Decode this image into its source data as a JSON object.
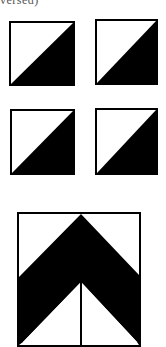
{
  "header": {
    "clipped_text": "versed)"
  },
  "colors": {
    "fill": "#000000",
    "background": "#ffffff",
    "border": "#000000"
  },
  "tiles": [
    {
      "id": "top-left",
      "pattern": "half-square-triangle",
      "dark_half": "lower-right"
    },
    {
      "id": "top-right",
      "pattern": "half-square-triangle",
      "dark_half": "lower-right"
    },
    {
      "id": "middle-left",
      "pattern": "half-square-triangle",
      "dark_half": "lower-right"
    },
    {
      "id": "middle-right",
      "pattern": "half-square-triangle",
      "dark_half": "lower-right"
    }
  ],
  "combined_block": {
    "pattern": "chevron",
    "direction": "up",
    "description": "Four half-square triangles joined into a chevron"
  }
}
